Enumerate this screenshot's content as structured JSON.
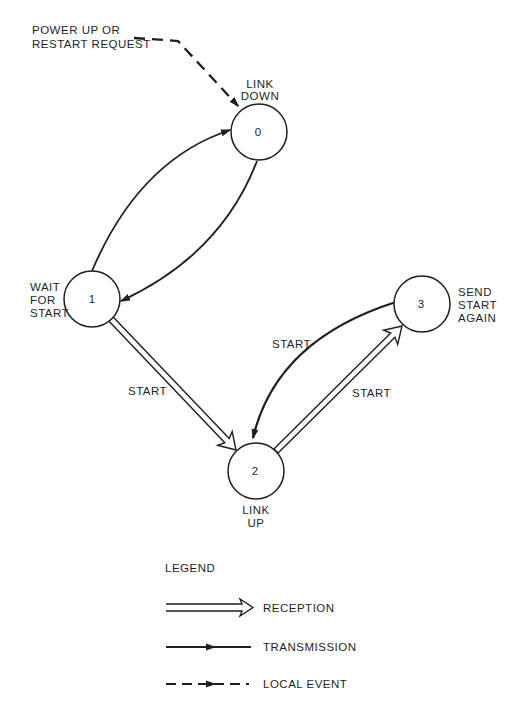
{
  "diagram_title": "Link start-up state diagram",
  "colors": {
    "ink": "#1f1f1f",
    "paper": "#ffffff"
  },
  "annotation": {
    "lines": [
      "POWER UP OR",
      "RESTART REQUEST"
    ]
  },
  "states": [
    {
      "number": "0",
      "name": "LINK DOWN",
      "name_lines": [
        "LINK",
        "DOWN"
      ]
    },
    {
      "number": "1",
      "name": "WAIT FOR START",
      "name_lines": [
        "WAIT",
        "FOR",
        "START"
      ]
    },
    {
      "number": "2",
      "name": "LINK UP",
      "name_lines": [
        "LINK",
        "UP"
      ]
    },
    {
      "number": "3",
      "name": "SEND START AGAIN",
      "name_lines": [
        "SEND",
        "START",
        "AGAIN"
      ]
    }
  ],
  "transitions": [
    {
      "from": "1",
      "to": "0",
      "type": "transmission",
      "label": ""
    },
    {
      "from": "0",
      "to": "1",
      "type": "transmission",
      "label": ""
    },
    {
      "from": "1",
      "to": "2",
      "type": "reception",
      "label": "START"
    },
    {
      "from": "2",
      "to": "3",
      "type": "reception",
      "label": "START"
    },
    {
      "from": "3",
      "to": "2",
      "type": "transmission",
      "label": "START"
    },
    {
      "from": "power-up-or-restart-request",
      "to": "0",
      "type": "local-event",
      "label": "POWER UP OR RESTART REQUEST"
    }
  ],
  "legend": {
    "title": "LEGEND",
    "items": [
      {
        "symbol": "reception-arrow",
        "label": "RECEPTION"
      },
      {
        "symbol": "transmission-arrow",
        "label": "TRANSMISSION"
      },
      {
        "symbol": "local-event-arrow",
        "label": "LOCAL EVENT"
      }
    ]
  }
}
